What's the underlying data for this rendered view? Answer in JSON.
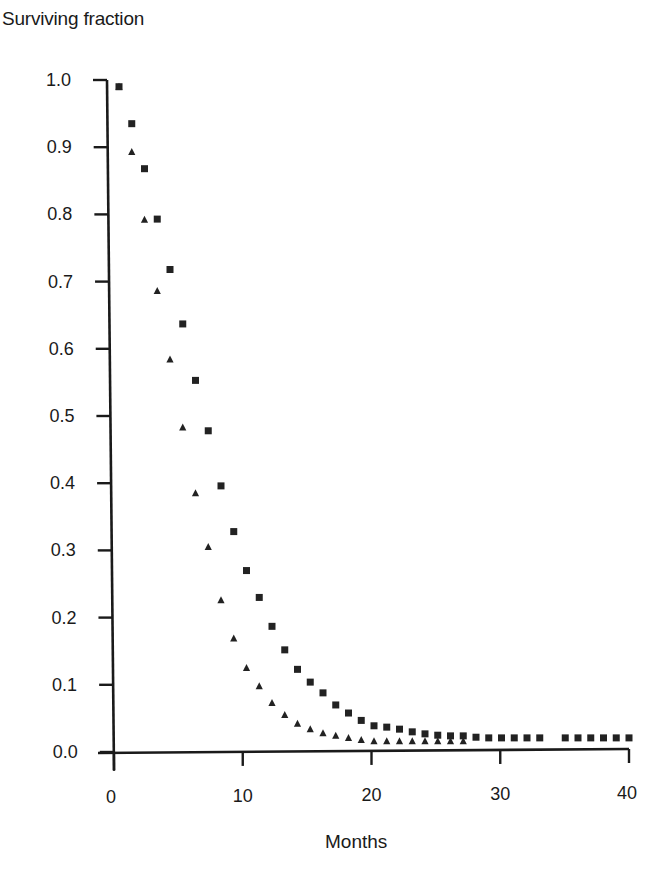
{
  "chart_data": {
    "type": "scatter",
    "title": "",
    "xlabel": "Months",
    "ylabel": "Surviving fraction",
    "xlim": [
      0,
      40
    ],
    "ylim": [
      0.0,
      1.0
    ],
    "xticks": [
      0,
      10,
      20,
      30,
      40
    ],
    "xtick_labels": [
      "0",
      "10",
      "20",
      "30",
      "40"
    ],
    "yticks": [
      0.0,
      0.1,
      0.2,
      0.3,
      0.4,
      0.5,
      0.6,
      0.7,
      0.8,
      0.9,
      1.0
    ],
    "ytick_labels": [
      "0.0",
      "0.1",
      "0.2",
      "0.3",
      "0.4",
      "0.5",
      "0.6",
      "0.7",
      "0.8",
      "0.9",
      "1.0"
    ],
    "grid": false,
    "legend": null,
    "series": [
      {
        "name": "squares",
        "marker": "square",
        "x": [
          0,
          1,
          2,
          3,
          4,
          5,
          6,
          7,
          8,
          9,
          10,
          11,
          12,
          13,
          14,
          15,
          16,
          17,
          18,
          19,
          20,
          21,
          22,
          23,
          24,
          25,
          26,
          27,
          28,
          29,
          30,
          31,
          32,
          33,
          35,
          36,
          37,
          38,
          39,
          40
        ],
        "values": [
          0.99,
          0.935,
          0.868,
          0.793,
          0.718,
          0.637,
          0.553,
          0.478,
          0.396,
          0.328,
          0.27,
          0.23,
          0.187,
          0.152,
          0.123,
          0.104,
          0.088,
          0.07,
          0.058,
          0.047,
          0.039,
          0.037,
          0.034,
          0.03,
          0.027,
          0.025,
          0.024,
          0.024,
          0.022,
          0.021,
          0.021,
          0.021,
          0.021,
          0.021,
          0.021,
          0.021,
          0.021,
          0.021,
          0.021,
          0.021
        ]
      },
      {
        "name": "triangles",
        "marker": "triangle",
        "x": [
          0,
          1,
          2,
          3,
          4,
          5,
          6,
          7,
          8,
          9,
          10,
          11,
          12,
          13,
          14,
          15,
          16,
          17,
          18,
          19,
          20,
          21,
          22,
          23,
          24,
          25,
          26,
          27
        ],
        "values": [
          0.99,
          0.893,
          0.792,
          0.686,
          0.584,
          0.483,
          0.385,
          0.305,
          0.226,
          0.169,
          0.125,
          0.098,
          0.073,
          0.055,
          0.042,
          0.034,
          0.028,
          0.024,
          0.021,
          0.018,
          0.016,
          0.016,
          0.016,
          0.016,
          0.016,
          0.016,
          0.016,
          0.016
        ]
      }
    ]
  },
  "colors": {
    "ink": "#1a1a1a",
    "background": "#ffffff"
  }
}
